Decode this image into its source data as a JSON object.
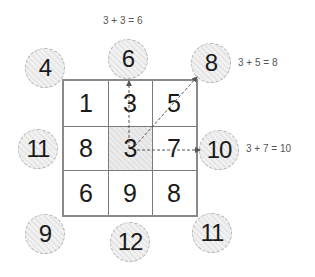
{
  "grid": {
    "rows": [
      [
        "1",
        "3",
        "5"
      ],
      [
        "8",
        "3",
        "7"
      ],
      [
        "6",
        "9",
        "8"
      ]
    ],
    "highlighted_cell": {
      "row": 1,
      "col": 1
    }
  },
  "circles": {
    "top_left": "4",
    "top": "6",
    "top_right": "8",
    "left": "11",
    "right": "10",
    "bottom_left": "9",
    "bottom": "12",
    "bottom_right": "11"
  },
  "equations": {
    "top": "3 + 3 = 6",
    "top_right": "3 + 5 = 8",
    "right": "3 + 7 = 10"
  },
  "colors": {
    "grid_border": "#8a8a8a",
    "circle_fill": "#ececec",
    "arrow": "#555555",
    "text": "#1a1a1a"
  }
}
